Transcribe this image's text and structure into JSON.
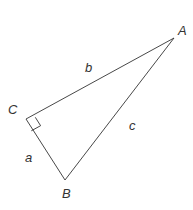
{
  "diagram": {
    "type": "right-triangle",
    "vertices": [
      {
        "name": "A",
        "x": 174,
        "y": 38,
        "label_x": 178,
        "label_y": 35
      },
      {
        "name": "C",
        "x": 26,
        "y": 119,
        "label_x": 8,
        "label_y": 114,
        "right_angle": true
      },
      {
        "name": "B",
        "x": 65,
        "y": 180,
        "label_x": 62,
        "label_y": 198
      }
    ],
    "sides": [
      {
        "name": "b",
        "from": "C",
        "to": "A",
        "label_x": 85,
        "label_y": 72
      },
      {
        "name": "c",
        "from": "B",
        "to": "A",
        "label_x": 129,
        "label_y": 130
      },
      {
        "name": "a",
        "from": "C",
        "to": "B",
        "label_x": 25,
        "label_y": 162
      }
    ],
    "stroke_color": "#333333",
    "label_color": "#333333"
  }
}
